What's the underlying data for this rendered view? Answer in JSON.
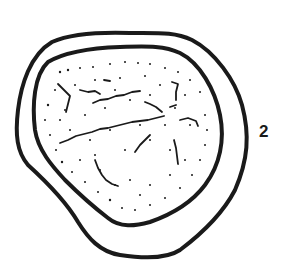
{
  "figure": {
    "label": "2",
    "colors": {
      "ink": "#1a1a1a",
      "background": "#ffffff"
    }
  }
}
